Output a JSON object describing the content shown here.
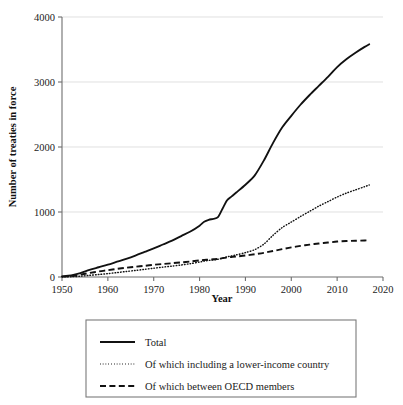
{
  "chart_data": {
    "type": "line",
    "title": "",
    "xlabel": "Year",
    "ylabel": "Number of treaties in force",
    "xlim": [
      1950,
      2020
    ],
    "ylim": [
      0,
      4000
    ],
    "xticks": [
      1950,
      1960,
      1970,
      1980,
      1990,
      2000,
      2010,
      2020
    ],
    "yticks": [
      0,
      1000,
      2000,
      3000,
      4000
    ],
    "grid": true,
    "legend_position": "below-plot",
    "x": [
      1950,
      1952,
      1954,
      1956,
      1958,
      1960,
      1962,
      1964,
      1966,
      1968,
      1970,
      1972,
      1974,
      1976,
      1978,
      1980,
      1981,
      1982,
      1983,
      1984,
      1985,
      1986,
      1987,
      1988,
      1990,
      1992,
      1994,
      1996,
      1998,
      2000,
      2002,
      2004,
      2006,
      2008,
      2010,
      2012,
      2014,
      2016,
      2017
    ],
    "series": [
      {
        "name": "Total",
        "style": "solid",
        "values": [
          10,
          25,
          60,
          110,
          150,
          190,
          235,
          280,
          330,
          385,
          440,
          500,
          560,
          630,
          700,
          790,
          850,
          880,
          895,
          920,
          1050,
          1180,
          1240,
          1300,
          1420,
          1560,
          1790,
          2060,
          2300,
          2480,
          2650,
          2800,
          2940,
          3080,
          3230,
          3350,
          3450,
          3540,
          3580
        ]
      },
      {
        "name": "Of which including a lower-income country",
        "style": "dotted",
        "values": [
          2,
          5,
          12,
          25,
          38,
          52,
          68,
          85,
          100,
          118,
          135,
          152,
          168,
          185,
          205,
          230,
          245,
          255,
          262,
          272,
          290,
          310,
          325,
          340,
          375,
          420,
          505,
          640,
          760,
          845,
          930,
          1010,
          1090,
          1160,
          1230,
          1290,
          1340,
          1390,
          1415
        ]
      },
      {
        "name": "Of which between OECD members",
        "style": "dashed",
        "values": [
          5,
          14,
          35,
          62,
          85,
          105,
          125,
          142,
          158,
          172,
          188,
          200,
          212,
          225,
          238,
          255,
          262,
          268,
          272,
          278,
          290,
          300,
          308,
          315,
          330,
          350,
          372,
          400,
          428,
          455,
          478,
          498,
          515,
          530,
          545,
          553,
          558,
          562,
          565
        ]
      }
    ]
  },
  "legend": {
    "items": [
      {
        "label": "Total",
        "style": "solid"
      },
      {
        "label": "Of which including a lower-income country",
        "style": "dotted"
      },
      {
        "label": "Of which between OECD members",
        "style": "dashed"
      }
    ]
  }
}
